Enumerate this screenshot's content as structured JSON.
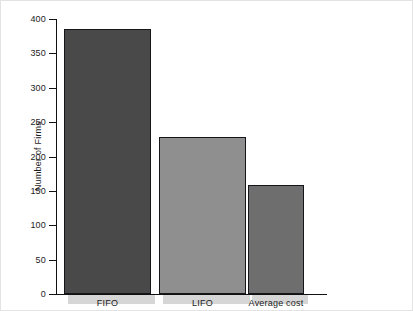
{
  "chart_data": {
    "type": "bar",
    "title": "",
    "xlabel": "",
    "ylabel": "Number of Firms",
    "categories": [
      "FIFO",
      "LIFO",
      "Average cost"
    ],
    "values": [
      385,
      228,
      158
    ],
    "ylim": [
      0,
      400
    ],
    "yticks": [
      0,
      50,
      100,
      150,
      200,
      250,
      300,
      350,
      400
    ],
    "ytick_labels": [
      "0",
      "50",
      "100",
      "150",
      "200",
      "250",
      "300",
      "350",
      "400"
    ],
    "grid": false,
    "legend": "none",
    "bar_colors": [
      "#494949",
      "#8f8f8f",
      "#6e6e6e"
    ],
    "bar_edge_color": "#15151a",
    "axis_color": "#111111",
    "shadow_color": "#d6d6d6",
    "background": "#ffffff"
  },
  "bars": [
    {
      "label": "FIFO",
      "value": 385,
      "color": "#494949",
      "left": 8,
      "width": 87
    },
    {
      "label": "LIFO",
      "value": 228,
      "color": "#8f8f8f",
      "left": 103,
      "width": 87
    },
    {
      "label": "Average cost",
      "value": 158,
      "color": "#6e6e6e",
      "left": 192,
      "width": 56
    }
  ]
}
